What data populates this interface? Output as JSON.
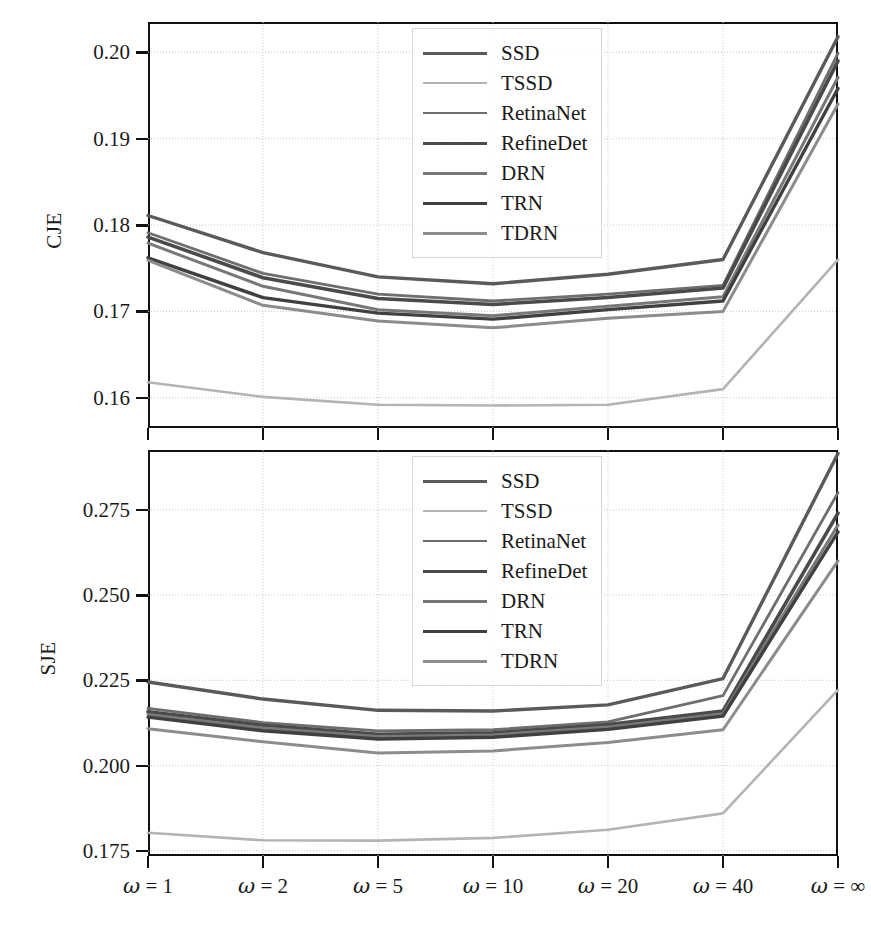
{
  "figure": {
    "width": 871,
    "height": 934,
    "background": "#ffffff"
  },
  "chart_data": [
    {
      "type": "line",
      "id": "cje-panel",
      "title": "",
      "xlabel": "",
      "ylabel": "CJE",
      "x": [
        "ω = 1",
        "ω = 2",
        "ω = 5",
        "ω = 10",
        "ω = 20",
        "ω = 40",
        "ω = ∞"
      ],
      "xticklabels": [
        "ω = 1",
        "ω = 2",
        "ω = 5",
        "ω = 10",
        "ω = 20",
        "ω = 40",
        "ω = ∞"
      ],
      "yticks": [
        0.16,
        0.17,
        0.18,
        0.19,
        0.2
      ],
      "yticklabels": [
        "0.16",
        "0.17",
        "0.18",
        "0.19",
        "0.20"
      ],
      "ylim": [
        0.1565,
        0.2035
      ],
      "grid": true,
      "legend_position": "upper-center",
      "series": [
        {
          "name": "SSD",
          "color": "#5a5a5a",
          "width": 3.4,
          "values": [
            0.1811,
            0.1768,
            0.174,
            0.1732,
            0.1743,
            0.176,
            0.2018
          ]
        },
        {
          "name": "TSSD",
          "color": "#b4b4b4",
          "width": 2.6,
          "values": [
            0.1618,
            0.1601,
            0.1592,
            0.1591,
            0.1592,
            0.161,
            0.176
          ]
        },
        {
          "name": "RetinaNet",
          "color": "#6e6e6e",
          "width": 2.8,
          "values": [
            0.1791,
            0.1744,
            0.172,
            0.1712,
            0.172,
            0.173,
            0.1999
          ]
        },
        {
          "name": "RefineDet",
          "color": "#4a4a4a",
          "width": 3.6,
          "values": [
            0.1786,
            0.1739,
            0.1715,
            0.1708,
            0.1716,
            0.1727,
            0.199
          ]
        },
        {
          "name": "DRN",
          "color": "#787878",
          "width": 3.0,
          "values": [
            0.1779,
            0.1729,
            0.1702,
            0.1695,
            0.1706,
            0.1717,
            0.1971
          ]
        },
        {
          "name": "TRN",
          "color": "#404040",
          "width": 3.4,
          "values": [
            0.1762,
            0.1716,
            0.1698,
            0.1691,
            0.1702,
            0.1712,
            0.1958
          ]
        },
        {
          "name": "TDRN",
          "color": "#8c8c8c",
          "width": 3.0,
          "values": [
            0.1759,
            0.1707,
            0.1689,
            0.1681,
            0.1692,
            0.17,
            0.194
          ]
        }
      ]
    },
    {
      "type": "line",
      "id": "sje-panel",
      "title": "",
      "xlabel": "",
      "ylabel": "SJE",
      "x": [
        "ω = 1",
        "ω = 2",
        "ω = 5",
        "ω = 10",
        "ω = 20",
        "ω = 40",
        "ω = ∞"
      ],
      "xticklabels": [
        "ω = 1",
        "ω = 2",
        "ω = 5",
        "ω = 10",
        "ω = 20",
        "ω = 40",
        "ω = ∞"
      ],
      "yticks": [
        0.175,
        0.2,
        0.225,
        0.25,
        0.275
      ],
      "yticklabels": [
        "0.175",
        "0.200",
        "0.225",
        "0.250",
        "0.275"
      ],
      "ylim": [
        0.1735,
        0.2925
      ],
      "grid": true,
      "legend_position": "upper-center",
      "series": [
        {
          "name": "SSD",
          "color": "#5a5a5a",
          "width": 3.4,
          "values": [
            0.2245,
            0.2195,
            0.2162,
            0.216,
            0.2178,
            0.2255,
            0.2915
          ]
        },
        {
          "name": "TSSD",
          "color": "#b4b4b4",
          "width": 2.6,
          "values": [
            0.1803,
            0.1781,
            0.178,
            0.1788,
            0.1812,
            0.186,
            0.2222
          ]
        },
        {
          "name": "RetinaNet",
          "color": "#6e6e6e",
          "width": 2.8,
          "values": [
            0.2168,
            0.2126,
            0.2102,
            0.2105,
            0.2128,
            0.2205,
            0.28
          ]
        },
        {
          "name": "RefineDet",
          "color": "#4a4a4a",
          "width": 3.6,
          "values": [
            0.2158,
            0.2118,
            0.2092,
            0.2096,
            0.212,
            0.216,
            0.274
          ]
        },
        {
          "name": "DRN",
          "color": "#787878",
          "width": 3.0,
          "values": [
            0.215,
            0.211,
            0.2085,
            0.209,
            0.2113,
            0.2152,
            0.2705
          ]
        },
        {
          "name": "TRN",
          "color": "#404040",
          "width": 3.4,
          "values": [
            0.2142,
            0.2102,
            0.2078,
            0.2083,
            0.2106,
            0.2145,
            0.2685
          ]
        },
        {
          "name": "TDRN",
          "color": "#8c8c8c",
          "width": 3.0,
          "values": [
            0.2108,
            0.207,
            0.2037,
            0.2043,
            0.2068,
            0.2105,
            0.26
          ]
        }
      ]
    }
  ],
  "legend": {
    "items": [
      "SSD",
      "TSSD",
      "RetinaNet",
      "RefineDet",
      "DRN",
      "TRN",
      "TDRN"
    ]
  },
  "colors": {
    "axis": "#111111",
    "grid": "#c8c8c8",
    "text": "#1a1a1a"
  }
}
